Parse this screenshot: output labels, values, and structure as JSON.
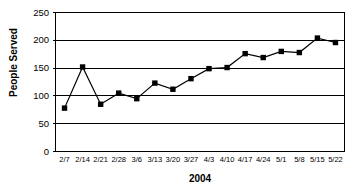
{
  "chart_data": {
    "type": "line",
    "title": "",
    "xlabel": "2004",
    "ylabel": "People Served",
    "ylim": [
      0,
      250
    ],
    "yticks": [
      0,
      50,
      100,
      150,
      200,
      250
    ],
    "ytick_labels": [
      "0",
      "50",
      "100",
      "150",
      "200",
      "250"
    ],
    "grid": true,
    "gridlines_at": [
      50,
      100,
      150,
      200
    ],
    "legend": false,
    "legend_position": "none",
    "marker": "filled-square",
    "marker_color": "#000000",
    "line_color": "#000000",
    "plot_background": "#ffffff",
    "border_color": "#000000",
    "categories": [
      "2/7",
      "2/14",
      "2/21",
      "2/28",
      "3/6",
      "3/13",
      "3/20",
      "3/27",
      "4/3",
      "4/10",
      "4/17",
      "4/24",
      "5/1",
      "5/8",
      "5/15",
      "5/22"
    ],
    "values": [
      78,
      152,
      85,
      105,
      95,
      123,
      112,
      131,
      149,
      151,
      176,
      169,
      180,
      178,
      204,
      196
    ],
    "series": [
      {
        "name": "People Served",
        "values": [
          78,
          152,
          85,
          105,
          95,
          123,
          112,
          131,
          149,
          151,
          176,
          169,
          180,
          178,
          204,
          196
        ]
      }
    ]
  }
}
